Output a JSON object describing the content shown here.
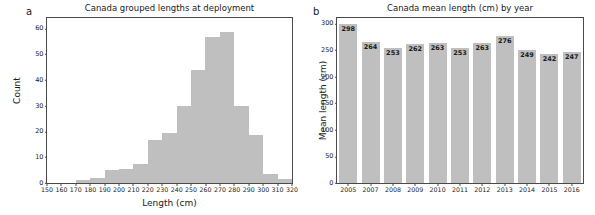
{
  "figure": {
    "panel_a_letter": "a",
    "panel_b_letter": "b"
  },
  "chart_data": [
    {
      "type": "bar",
      "panel": "a",
      "title": "Canada grouped lengths at deployment",
      "xlabel": "Length (cm)",
      "ylabel": "Count",
      "xlim": [
        150,
        320
      ],
      "ylim": [
        0,
        64
      ],
      "yticks": [
        0,
        10,
        20,
        30,
        40,
        50,
        60
      ],
      "xticks": [
        150,
        160,
        170,
        180,
        190,
        200,
        210,
        220,
        230,
        240,
        250,
        260,
        270,
        280,
        290,
        300,
        310,
        320
      ],
      "grid": false,
      "legend": "none",
      "bin_width": 10,
      "bin_starts": [
        150,
        160,
        170,
        180,
        190,
        200,
        210,
        220,
        230,
        240,
        250,
        260,
        270,
        280,
        290,
        300,
        310
      ],
      "categories": [
        "150-160",
        "160-170",
        "170-180",
        "180-190",
        "190-200",
        "200-210",
        "210-220",
        "220-230",
        "230-240",
        "240-250",
        "250-260",
        "260-270",
        "270-280",
        "280-290",
        "290-300",
        "300-310",
        "310-320"
      ],
      "values": [
        0,
        0,
        1,
        2,
        5,
        5.5,
        7.5,
        16.5,
        19.5,
        30,
        44,
        56.5,
        58.5,
        30,
        18.5,
        3.5,
        1.5
      ],
      "bar_color": "#bfbfbf"
    },
    {
      "type": "bar",
      "panel": "b",
      "title": "Canada mean length (cm) by year",
      "xlabel": "",
      "ylabel": "Mean length (cm)",
      "ylim": [
        0,
        310
      ],
      "yticks": [
        0,
        50,
        100,
        150,
        200,
        250,
        300
      ],
      "grid": false,
      "legend": "none",
      "categories": [
        "2005",
        "2007",
        "2008",
        "2009",
        "2010",
        "2011",
        "2012",
        "2013",
        "2014",
        "2015",
        "2016"
      ],
      "values": [
        298,
        264,
        253,
        262,
        263,
        253,
        263,
        276,
        249,
        242,
        247
      ],
      "data_labels": [
        "298",
        "264",
        "253",
        "262",
        "263",
        "253",
        "263",
        "276",
        "249",
        "242",
        "247"
      ],
      "bar_color": "#bfbfbf"
    }
  ]
}
